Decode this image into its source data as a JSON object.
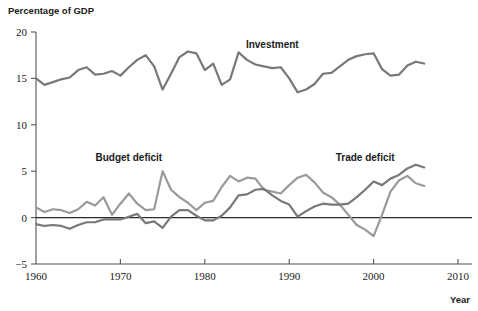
{
  "chart_data": {
    "type": "line",
    "title": "",
    "ylabel": "Percentage of GDP",
    "xlabel": "Year",
    "ylim": [
      -5,
      20
    ],
    "xlim": [
      1960,
      2010
    ],
    "yticks": [
      -5,
      0,
      5,
      10,
      15,
      20
    ],
    "ytick_labels": [
      "−5",
      "0",
      "5",
      "10",
      "15",
      "20"
    ],
    "xticks": [
      1960,
      1970,
      1980,
      1990,
      2000,
      2010
    ],
    "xtick_labels": [
      "1960",
      "1970",
      "1980",
      "1990",
      "2000",
      "2010"
    ],
    "grid": false,
    "legend_position": "inline-annotations",
    "zero_reference_line": true,
    "series": [
      {
        "name": "Investment",
        "color": "#787878",
        "label_x": 1988,
        "label_y": 18.3,
        "x": [
          1960,
          1961,
          1962,
          1963,
          1964,
          1965,
          1966,
          1967,
          1968,
          1969,
          1970,
          1971,
          1972,
          1973,
          1974,
          1975,
          1976,
          1977,
          1978,
          1979,
          1980,
          1981,
          1982,
          1983,
          1984,
          1985,
          1986,
          1987,
          1988,
          1989,
          1990,
          1991,
          1992,
          1993,
          1994,
          1995,
          1996,
          1997,
          1998,
          1999,
          2000,
          2001,
          2002,
          2003,
          2004,
          2005,
          2006
        ],
        "values": [
          15.0,
          14.3,
          14.6,
          14.9,
          15.1,
          15.9,
          16.2,
          15.4,
          15.5,
          15.8,
          15.3,
          16.2,
          17.0,
          17.5,
          16.3,
          13.8,
          15.5,
          17.3,
          17.9,
          17.7,
          15.9,
          16.6,
          14.3,
          14.9,
          17.8,
          17.0,
          16.5,
          16.3,
          16.1,
          16.2,
          15.0,
          13.5,
          13.8,
          14.4,
          15.5,
          15.6,
          16.3,
          17.0,
          17.4,
          17.6,
          17.7,
          16.0,
          15.3,
          15.4,
          16.4,
          16.8,
          16.6
        ]
      },
      {
        "name": "Budget deficit",
        "color": "#9a9a9a",
        "label_x": 1971,
        "label_y": 6.1,
        "x": [
          1960,
          1961,
          1962,
          1963,
          1964,
          1965,
          1966,
          1967,
          1968,
          1969,
          1970,
          1971,
          1972,
          1973,
          1974,
          1975,
          1976,
          1977,
          1978,
          1979,
          1980,
          1981,
          1982,
          1983,
          1984,
          1985,
          1986,
          1987,
          1988,
          1989,
          1990,
          1991,
          1992,
          1993,
          1994,
          1995,
          1996,
          1997,
          1998,
          1999,
          2000,
          2001,
          2002,
          2003,
          2004,
          2005,
          2006
        ],
        "values": [
          1.1,
          0.6,
          0.9,
          0.8,
          0.5,
          0.9,
          1.7,
          1.3,
          2.2,
          0.3,
          1.5,
          2.6,
          1.5,
          0.8,
          0.9,
          5.0,
          3.0,
          2.2,
          1.6,
          0.8,
          1.6,
          1.8,
          3.3,
          4.5,
          3.9,
          4.3,
          4.2,
          3.0,
          2.8,
          2.6,
          3.5,
          4.3,
          4.6,
          3.8,
          2.7,
          2.2,
          1.4,
          0.3,
          -0.8,
          -1.3,
          -2.0,
          0.3,
          2.8,
          4.0,
          4.5,
          3.7,
          3.4
        ]
      },
      {
        "name": "Trade deficit",
        "color": "#787878",
        "label_x": 1999,
        "label_y": 6.1,
        "x": [
          1960,
          1961,
          1962,
          1963,
          1964,
          1965,
          1966,
          1967,
          1968,
          1969,
          1970,
          1971,
          1972,
          1973,
          1974,
          1975,
          1976,
          1977,
          1978,
          1979,
          1980,
          1981,
          1982,
          1983,
          1984,
          1985,
          1986,
          1987,
          1988,
          1989,
          1990,
          1991,
          1992,
          1993,
          1994,
          1995,
          1996,
          1997,
          1998,
          1999,
          2000,
          2001,
          2002,
          2003,
          2004,
          2005,
          2006
        ],
        "values": [
          -0.7,
          -0.9,
          -0.8,
          -0.9,
          -1.2,
          -0.8,
          -0.5,
          -0.5,
          -0.2,
          -0.2,
          -0.2,
          0.1,
          0.4,
          -0.6,
          -0.4,
          -1.1,
          0.1,
          0.8,
          0.8,
          0.2,
          -0.3,
          -0.3,
          0.2,
          1.1,
          2.4,
          2.5,
          3.0,
          3.1,
          2.4,
          1.8,
          1.4,
          0.1,
          0.7,
          1.2,
          1.5,
          1.4,
          1.4,
          1.5,
          2.2,
          3.0,
          3.9,
          3.5,
          4.2,
          4.6,
          5.3,
          5.7,
          5.4
        ]
      }
    ]
  },
  "labels": {
    "y_axis_title": "Percentage of GDP",
    "x_axis_title": "Year",
    "investment": "Investment",
    "budget_deficit": "Budget deficit",
    "trade_deficit": "Trade deficit"
  }
}
